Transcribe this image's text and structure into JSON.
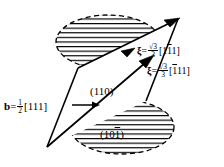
{
  "figure": {
    "background_color": "#ffffff",
    "line_color": "#000000",
    "hatch_color": "#000000"
  },
  "labels": {
    "burgers_vector": {
      "symbol": "b",
      "equals": "=",
      "numerator": "1",
      "denominator": "2",
      "bracket_open": "[",
      "indices": "111",
      "bracket_close": "]",
      "full_text": "b = 1/2[111]"
    },
    "xi_upper": {
      "symbol": "ξ",
      "equals": "=",
      "numerator": "√3",
      "denominator": "3",
      "bracket_open": "[",
      "index_1": "1",
      "index_2_bar": "1",
      "index_3": "1",
      "bracket_close": "]",
      "full_text": "ξ = (√3/3)[1 1̄ 1]"
    },
    "xi_lower": {
      "symbol": "ξ",
      "equals": "=",
      "numerator": "√3",
      "denominator": "3",
      "bracket_open": "[",
      "index_1_bar": "1",
      "index_2": "1",
      "index_3": "1",
      "bracket_close": "]",
      "full_text": "ξ = (√3/3)[1̄ 1 1]"
    },
    "plane_upper": {
      "text": "(110)"
    },
    "plane_lower": {
      "bracket_open": "(",
      "index_1": "1",
      "index_2": "0",
      "index_3_bar": "1",
      "bracket_close": ")",
      "full_text": "(10̄1̄)"
    }
  },
  "geometry": {
    "slip_band_vertices": [
      [
        47,
        147
      ],
      [
        78,
        68
      ],
      [
        146,
        101
      ],
      [
        178,
        19
      ]
    ],
    "upper_ellipse": {
      "cx": 108,
      "cy": 42,
      "rx": 52,
      "ry": 27
    },
    "lower_ellipse": {
      "cx": 122,
      "cy": 127,
      "rx": 52,
      "ry": 27
    },
    "hatch_spacing_px": 4.5,
    "burgers_arrow": {
      "x1": 72,
      "y1": 105,
      "x2": 98,
      "y2": 105
    }
  }
}
